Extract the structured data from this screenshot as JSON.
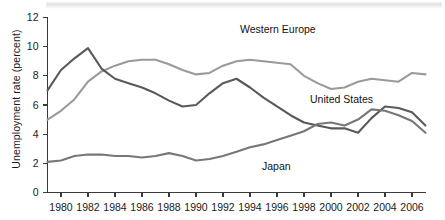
{
  "chart_data": {
    "type": "line",
    "title": "",
    "xlabel": "",
    "ylabel": "Unemployment rate (percent)",
    "xlim": [
      1979,
      2007
    ],
    "ylim": [
      0,
      12
    ],
    "ytick_labels": [
      "0",
      "2",
      "4",
      "6",
      "8",
      "10",
      "12"
    ],
    "yticks": [
      0,
      2,
      4,
      6,
      8,
      10,
      12
    ],
    "xtick_labels": [
      "1980",
      "1982",
      "1984",
      "1986",
      "1988",
      "1990",
      "1992",
      "1994",
      "1996",
      "1998",
      "2000",
      "2002",
      "2004",
      "2006"
    ],
    "xticks": [
      1980,
      1982,
      1984,
      1986,
      1988,
      1990,
      1992,
      1994,
      1996,
      1998,
      2000,
      2002,
      2004,
      2006
    ],
    "grid": false,
    "legend": "inline-annotations",
    "x": [
      1979,
      1980,
      1981,
      1982,
      1983,
      1984,
      1985,
      1986,
      1987,
      1988,
      1989,
      1990,
      1991,
      1992,
      1993,
      1994,
      1995,
      1996,
      1997,
      1998,
      1999,
      2000,
      2001,
      2002,
      2003,
      2004,
      2005,
      2006,
      2007
    ],
    "series": [
      {
        "name": "Western Europe",
        "color": "#9a9a9a",
        "values": [
          5.0,
          5.6,
          6.4,
          7.6,
          8.3,
          8.7,
          9.0,
          9.1,
          9.1,
          8.8,
          8.4,
          8.1,
          8.2,
          8.7,
          9.0,
          9.1,
          9.0,
          8.9,
          8.8,
          8.0,
          7.5,
          7.1,
          7.2,
          7.6,
          7.8,
          7.7,
          7.6,
          8.2,
          8.1
        ]
      },
      {
        "name": "United States",
        "color": "#595959",
        "values": [
          7.0,
          8.4,
          9.2,
          9.9,
          8.5,
          7.8,
          7.5,
          7.2,
          6.8,
          6.3,
          5.9,
          6.0,
          6.8,
          7.5,
          7.8,
          7.2,
          6.5,
          5.9,
          5.3,
          4.8,
          4.6,
          4.4,
          4.4,
          4.1,
          5.1,
          5.9,
          5.8,
          5.5,
          4.6
        ]
      },
      {
        "name": "Japan",
        "color": "#777777",
        "values": [
          2.1,
          2.2,
          2.5,
          2.6,
          2.6,
          2.5,
          2.5,
          2.4,
          2.5,
          2.7,
          2.5,
          2.2,
          2.3,
          2.5,
          2.8,
          3.1,
          3.3,
          3.6,
          3.9,
          4.2,
          4.7,
          4.8,
          4.6,
          5.0,
          5.7,
          5.6,
          5.3,
          4.9,
          4.1
        ]
      }
    ],
    "annotations": [
      {
        "text": "Western Europe",
        "series": "Western Europe",
        "x_px": 240,
        "y_px": 24
      },
      {
        "text": "United States",
        "series": "United States",
        "x_px": 310,
        "y_px": 94
      },
      {
        "text": "Japan",
        "series": "Japan",
        "x_px": 262,
        "y_px": 161
      }
    ]
  }
}
